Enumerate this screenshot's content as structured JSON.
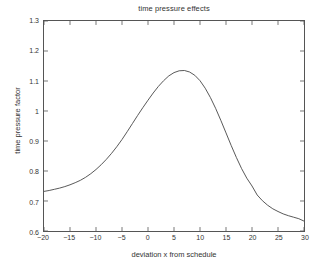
{
  "figure": {
    "background_color": "#ffffff",
    "axes_color": "#555555",
    "text_color": "#333333"
  },
  "chart_data": {
    "type": "line",
    "title": "time pressure effects",
    "xlabel": "deviation x from schedule",
    "ylabel": "time pressure factor",
    "xlim": [
      -20,
      30
    ],
    "ylim": [
      0.6,
      1.3
    ],
    "xticks": [
      -20,
      -15,
      -10,
      -5,
      0,
      5,
      10,
      15,
      20,
      25,
      30
    ],
    "xtick_labels": [
      "−20",
      "−15",
      "−10",
      "−5",
      "0",
      "5",
      "10",
      "15",
      "20",
      "25",
      "30"
    ],
    "yticks": [
      0.6,
      0.7,
      0.8,
      0.9,
      1.0,
      1.1,
      1.2,
      1.3
    ],
    "ytick_labels": [
      "0.6",
      "0.7",
      "0.8",
      "0.9",
      "1",
      "1.1",
      "1.2",
      "1.3"
    ],
    "grid": false,
    "legend": null,
    "line_color": "#444444",
    "line_width": 0.9,
    "series": [
      {
        "name": "time pressure factor",
        "x": [
          -20,
          -19,
          -18,
          -17,
          -16,
          -15,
          -14,
          -13,
          -12,
          -11,
          -10,
          -9,
          -8,
          -7,
          -6,
          -5,
          -4,
          -3,
          -2,
          -1,
          0,
          1,
          2,
          3,
          4,
          5,
          6,
          7,
          8,
          9,
          10,
          11,
          12,
          13,
          14,
          15,
          16,
          17,
          18,
          19,
          20,
          21,
          22,
          23,
          24,
          25,
          26,
          27,
          28,
          29,
          30
        ],
        "y": [
          0.732,
          0.735,
          0.739,
          0.743,
          0.748,
          0.754,
          0.761,
          0.769,
          0.779,
          0.791,
          0.805,
          0.821,
          0.839,
          0.859,
          0.881,
          0.905,
          0.931,
          0.958,
          0.985,
          1.011,
          1.036,
          1.06,
          1.082,
          1.101,
          1.117,
          1.128,
          1.134,
          1.135,
          1.13,
          1.119,
          1.101,
          1.076,
          1.045,
          1.009,
          0.969,
          0.927,
          0.885,
          0.845,
          0.808,
          0.776,
          0.75,
          0.72,
          0.701,
          0.686,
          0.674,
          0.665,
          0.657,
          0.651,
          0.646,
          0.641,
          0.633
        ]
      }
    ],
    "peak": {
      "x": 6.5,
      "y": 1.135
    },
    "left_endpoint": {
      "x": -20,
      "y": 0.732
    },
    "right_endpoint": {
      "x": 30,
      "y": 0.633
    }
  }
}
